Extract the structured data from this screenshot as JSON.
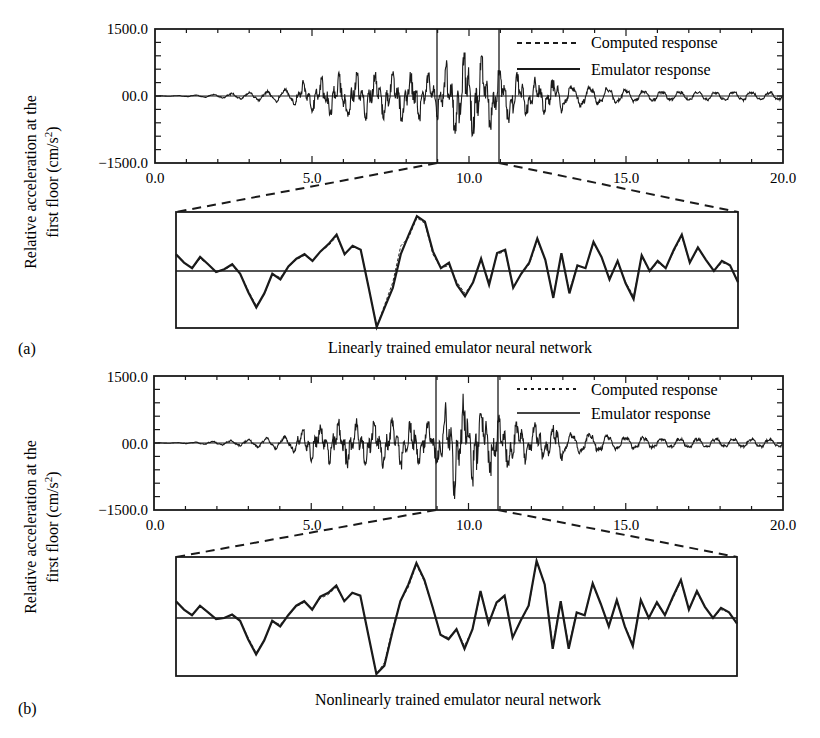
{
  "chart_data": [
    {
      "panel": "(a)",
      "type": "line",
      "title": "",
      "caption": "Linearly trained emulator neural network",
      "xlabel": "",
      "ylabel": "Relative acceleration at the first floor (cm/s²)",
      "ylabel_line1": "Relative acceleration at the",
      "ylabel_line2": "first floor (cm/s",
      "ylabel_sup": "2",
      "ylabel_close": ")",
      "xlim": [
        0.0,
        20.0
      ],
      "ylim": [
        -1500.0,
        1500.0
      ],
      "x_ticks": [
        "0.0",
        "5.0",
        "10.0",
        "15.0",
        "20.0"
      ],
      "y_ticks": [
        "1500.0",
        "00.0",
        "-1500.0"
      ],
      "zoom_window": [
        9.0,
        11.0
      ],
      "legend": {
        "position": "upper right",
        "entries": [
          "Computed response",
          "Emulator response"
        ]
      },
      "series": [
        {
          "name": "Computed response",
          "style": "dashed",
          "envelope_x": [
            0,
            1,
            2,
            3,
            4,
            5,
            6,
            7,
            8,
            9,
            9.5,
            10,
            10.5,
            11,
            12,
            13,
            14,
            15,
            16,
            17,
            18,
            19,
            20
          ],
          "envelope_amp": [
            0,
            20,
            60,
            120,
            200,
            380,
            520,
            520,
            560,
            500,
            900,
            1000,
            850,
            600,
            450,
            380,
            320,
            220,
            180,
            170,
            160,
            150,
            140
          ]
        },
        {
          "name": "Emulator response",
          "style": "solid",
          "envelope_x": [
            0,
            1,
            2,
            3,
            4,
            5,
            6,
            7,
            8,
            9,
            9.5,
            10,
            10.5,
            11,
            12,
            13,
            14,
            15,
            16,
            17,
            18,
            19,
            20
          ],
          "envelope_amp": [
            0,
            20,
            60,
            120,
            200,
            380,
            520,
            520,
            560,
            500,
            900,
            1000,
            850,
            600,
            450,
            380,
            320,
            220,
            180,
            170,
            160,
            150,
            140
          ]
        }
      ],
      "inset": {
        "x_range": [
          9.0,
          11.0
        ],
        "computed": [
          0.28,
          0.15,
          0.05,
          0.22,
          0.12,
          -0.02,
          0.02,
          0.1,
          -0.05,
          -0.35,
          -0.62,
          -0.42,
          -0.05,
          -0.12,
          0.08,
          0.2,
          0.28,
          0.18,
          0.35,
          0.45,
          0.62,
          0.3,
          0.45,
          0.38,
          -0.3,
          -1.0,
          -0.6,
          -0.2,
          0.45,
          0.6,
          0.95,
          0.85,
          0.3,
          0.05,
          0.1,
          -0.2,
          -0.4,
          -0.2,
          0.2,
          -0.2,
          0.3,
          0.35,
          -0.3,
          -0.05,
          0.12,
          0.55,
          0.2,
          -0.45,
          0.3,
          -0.35,
          0.1,
          0.05,
          0.5,
          0.25,
          -0.15,
          0.15,
          -0.2,
          -0.45,
          0.25,
          0.0,
          0.15,
          0.05,
          0.35,
          0.62,
          0.15,
          0.4,
          0.2,
          0.0,
          0.15,
          0.1,
          -0.2
        ],
        "emulator": [
          0.3,
          0.15,
          0.05,
          0.25,
          0.12,
          -0.02,
          0.03,
          0.12,
          -0.05,
          -0.38,
          -0.65,
          -0.4,
          -0.05,
          -0.15,
          0.08,
          0.22,
          0.3,
          0.18,
          0.35,
          0.48,
          0.65,
          0.3,
          0.45,
          0.38,
          -0.3,
          -1.0,
          -0.65,
          -0.3,
          0.3,
          0.65,
          0.98,
          0.88,
          0.35,
          0.05,
          0.15,
          -0.25,
          -0.45,
          -0.2,
          0.22,
          -0.25,
          0.32,
          0.38,
          -0.3,
          -0.05,
          0.15,
          0.58,
          0.2,
          -0.48,
          0.32,
          -0.4,
          0.1,
          0.05,
          0.52,
          0.25,
          -0.15,
          0.18,
          -0.22,
          -0.5,
          0.28,
          0.0,
          0.18,
          0.05,
          0.38,
          0.65,
          0.15,
          0.42,
          0.2,
          0.0,
          0.18,
          0.1,
          -0.2
        ]
      }
    },
    {
      "panel": "(b)",
      "type": "line",
      "title": "",
      "caption": "Nonlinearly trained emulator neural network",
      "xlabel": "",
      "ylabel": "Relative acceleration at the first floor (cm/s²)",
      "ylabel_line1": "Relative acceleration at the",
      "ylabel_line2": "first floor (cm/s",
      "ylabel_sup": "2",
      "ylabel_close": ")",
      "xlim": [
        0.0,
        20.0
      ],
      "ylim": [
        -1500.0,
        1500.0
      ],
      "x_ticks": [
        "0.0",
        "5.0",
        "10.0",
        "15.0",
        "20.0"
      ],
      "y_ticks": [
        "1500.0",
        "00.0",
        "-1500.0"
      ],
      "zoom_window": [
        9.0,
        11.0
      ],
      "legend": {
        "position": "upper right",
        "entries": [
          "Computed response",
          "Emulator response"
        ]
      },
      "series": [
        {
          "name": "Computed response",
          "style": "dashed",
          "envelope_x": [
            0,
            1,
            2,
            3,
            4,
            5,
            6,
            7,
            8,
            9,
            9.5,
            10,
            10.5,
            11,
            12,
            13,
            14,
            15,
            16,
            17,
            18,
            19,
            20
          ],
          "envelope_amp": [
            0,
            20,
            60,
            120,
            200,
            380,
            520,
            520,
            560,
            500,
            1150,
            1000,
            850,
            600,
            450,
            380,
            320,
            220,
            180,
            170,
            160,
            150,
            140
          ]
        },
        {
          "name": "Emulator response",
          "style": "solid",
          "envelope_x": [
            0,
            1,
            2,
            3,
            4,
            5,
            6,
            7,
            8,
            9,
            9.5,
            10,
            10.5,
            11,
            12,
            13,
            14,
            15,
            16,
            17,
            18,
            19,
            20
          ],
          "envelope_amp": [
            0,
            20,
            60,
            120,
            200,
            380,
            520,
            520,
            560,
            500,
            1150,
            1000,
            850,
            600,
            450,
            380,
            320,
            220,
            180,
            170,
            160,
            150,
            140
          ]
        }
      ],
      "inset": {
        "x_range": [
          9.0,
          11.0
        ],
        "computed": [
          0.28,
          0.15,
          0.05,
          0.2,
          0.1,
          -0.02,
          0.0,
          0.05,
          -0.05,
          -0.35,
          -0.62,
          -0.4,
          -0.05,
          -0.12,
          0.05,
          0.2,
          0.28,
          0.15,
          0.35,
          0.42,
          0.55,
          0.3,
          0.45,
          0.4,
          -0.3,
          -1.0,
          -0.8,
          -0.2,
          0.3,
          0.55,
          0.95,
          0.65,
          0.2,
          -0.3,
          -0.35,
          -0.2,
          -0.5,
          -0.2,
          0.45,
          -0.1,
          0.25,
          0.38,
          -0.35,
          -0.05,
          0.2,
          1.0,
          0.6,
          -0.5,
          0.3,
          -0.5,
          0.1,
          0.05,
          0.6,
          0.25,
          -0.15,
          0.3,
          -0.15,
          -0.45,
          0.3,
          0.0,
          0.25,
          0.05,
          0.35,
          0.65,
          0.15,
          0.45,
          0.2,
          0.0,
          0.15,
          0.1,
          -0.1
        ],
        "emulator": [
          0.3,
          0.15,
          0.05,
          0.22,
          0.1,
          -0.02,
          0.0,
          0.06,
          -0.05,
          -0.38,
          -0.65,
          -0.4,
          -0.05,
          -0.15,
          0.05,
          0.22,
          0.3,
          0.15,
          0.38,
          0.45,
          0.58,
          0.3,
          0.45,
          0.4,
          -0.3,
          -1.0,
          -0.85,
          -0.25,
          0.3,
          0.6,
          0.98,
          0.68,
          0.2,
          -0.3,
          -0.38,
          -0.2,
          -0.55,
          -0.2,
          0.48,
          -0.1,
          0.28,
          0.4,
          -0.35,
          -0.05,
          0.22,
          1.02,
          0.6,
          -0.55,
          0.3,
          -0.55,
          0.1,
          0.05,
          0.62,
          0.25,
          -0.15,
          0.32,
          -0.15,
          -0.5,
          0.32,
          0.0,
          0.28,
          0.05,
          0.38,
          0.68,
          0.15,
          0.48,
          0.2,
          0.0,
          0.18,
          0.1,
          -0.1
        ]
      }
    }
  ],
  "panels": [
    {
      "label": "(a)",
      "caption": "Linearly trained emulator neural network",
      "ylabel_line1": "Relative acceleration at the",
      "ylabel_line2": "first floor (cm/s",
      "ylabel_sup": "2",
      "ylabel_close": ")",
      "y_ticks": [
        "1500.0",
        "00.0",
        "−1500.0"
      ],
      "x_ticks": [
        "0.0",
        "5.0",
        "10.0",
        "15.0",
        "20.0"
      ],
      "legend": [
        "Computed response",
        "Emulator response"
      ]
    },
    {
      "label": "(b)",
      "caption": "Nonlinearly trained emulator neural network",
      "ylabel_line1": "Relative acceleration at the",
      "ylabel_line2": "first floor (cm/s",
      "ylabel_sup": "2",
      "ylabel_close": ")",
      "y_ticks": [
        "1500.0",
        "00.0",
        "−1500.0"
      ],
      "x_ticks": [
        "0.0",
        "5.0",
        "10.0",
        "15.0",
        "20.0"
      ],
      "legend": [
        "Computed response",
        "Emulator response"
      ]
    }
  ]
}
